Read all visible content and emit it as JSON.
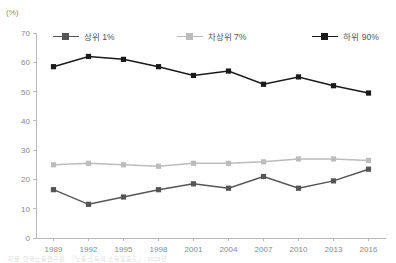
{
  "unit_label": "(%)",
  "caption": "자료: 한국노동연구원, 『노동 소득의 소득집중도』, 2018년",
  "legend": {
    "position": "top",
    "entries": [
      {
        "label": "상위 1%",
        "color": "#555555",
        "marker": "square"
      },
      {
        "label": "차상위 7%",
        "color": "#bcbcbc",
        "marker": "square"
      },
      {
        "label": "하위 90%",
        "color": "#1a1a1a",
        "marker": "square"
      }
    ]
  },
  "chart_data": {
    "type": "line",
    "title": "",
    "subtitle": "",
    "xlabel": "",
    "ylabel": "(%)",
    "grid": false,
    "legend_position": "top",
    "categories": [
      "1989",
      "1992",
      "1995",
      "1998",
      "2001",
      "2004",
      "2007",
      "2010",
      "2013",
      "2016"
    ],
    "x": [
      1989,
      1992,
      1995,
      1998,
      2001,
      2004,
      2007,
      2010,
      2013,
      2016
    ],
    "ylim": [
      0,
      70
    ],
    "yticks": [
      0,
      10,
      20,
      30,
      40,
      50,
      60,
      70
    ],
    "series": [
      {
        "name": "상위 1%",
        "color": "#555555",
        "values": [
          16.5,
          11.5,
          14.0,
          16.5,
          18.5,
          17.0,
          21.0,
          17.0,
          19.5,
          23.5
        ]
      },
      {
        "name": "차상위 7%",
        "color": "#bcbcbc",
        "values": [
          25.0,
          25.5,
          25.0,
          24.5,
          25.5,
          25.5,
          26.0,
          27.0,
          27.0,
          26.5
        ]
      },
      {
        "name": "하위 90%",
        "color": "#1a1a1a",
        "values": [
          58.5,
          62.0,
          61.0,
          58.5,
          55.5,
          57.0,
          52.5,
          55.0,
          52.0,
          49.5
        ]
      }
    ]
  },
  "axis": {
    "y_tick_labels": [
      "0",
      "10",
      "20",
      "30",
      "40",
      "50",
      "60",
      "70"
    ],
    "x_tick_labels": [
      "1989",
      "1992",
      "1995",
      "1998",
      "2001",
      "2004",
      "2007",
      "2010",
      "2013",
      "2016"
    ]
  }
}
